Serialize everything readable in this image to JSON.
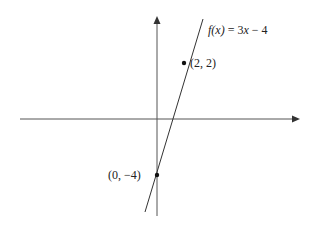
{
  "function_label": {
    "f_part": "f(x)",
    "equals": " = 3",
    "x_var": "x",
    "rest": " − 4"
  },
  "points": [
    {
      "label": "(2, 2)",
      "x": 2,
      "y": 2
    },
    {
      "label": "(0, −4)",
      "x": 0,
      "y": -4
    }
  ],
  "colors": {
    "axis": "#555555",
    "line": "#333333",
    "point": "#111111"
  }
}
